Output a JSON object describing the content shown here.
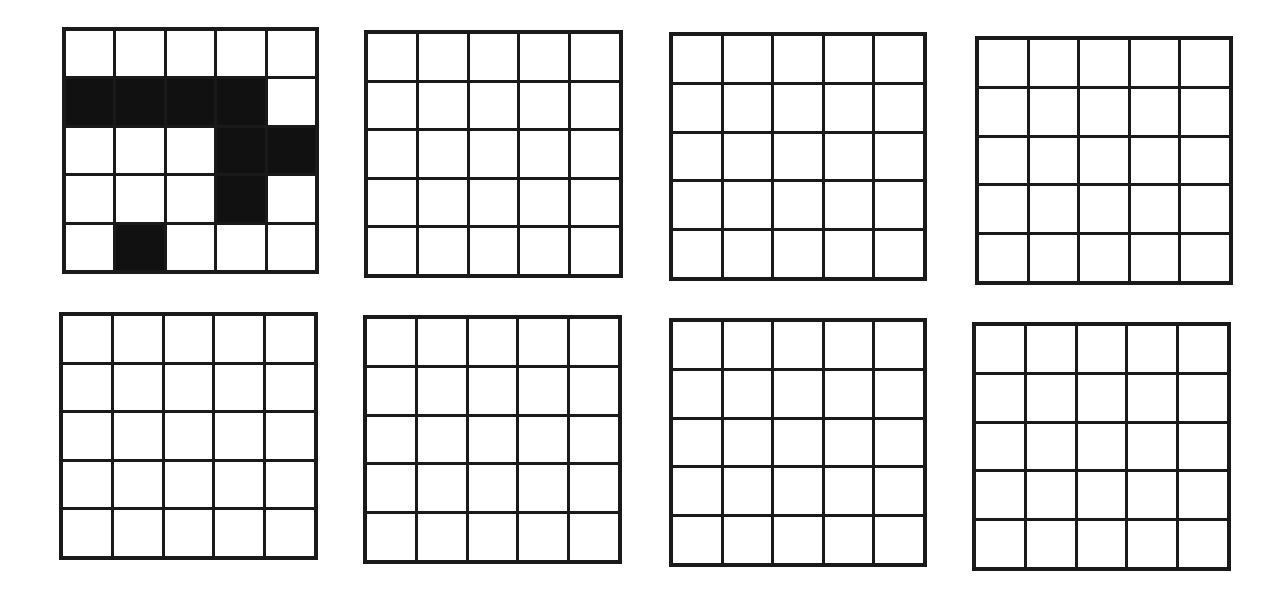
{
  "diagram": {
    "rows": 5,
    "cols": 5,
    "colors": {
      "filled": "#111111",
      "empty": "#ffffff",
      "line": "#1a1a1a"
    },
    "grids": [
      {
        "id": "grid-1",
        "position": {
          "x": 62,
          "y": 27,
          "w": 257,
          "h": 247
        },
        "filled_cells": [
          [
            1,
            0
          ],
          [
            1,
            1
          ],
          [
            1,
            2
          ],
          [
            1,
            3
          ],
          [
            2,
            3
          ],
          [
            2,
            4
          ],
          [
            3,
            3
          ],
          [
            4,
            1
          ]
        ]
      },
      {
        "id": "grid-2",
        "position": {
          "x": 364,
          "y": 30,
          "w": 259,
          "h": 248
        },
        "filled_cells": []
      },
      {
        "id": "grid-3",
        "position": {
          "x": 669,
          "y": 32,
          "w": 258,
          "h": 249
        },
        "filled_cells": []
      },
      {
        "id": "grid-4",
        "position": {
          "x": 975,
          "y": 36,
          "w": 258,
          "h": 249
        },
        "filled_cells": []
      },
      {
        "id": "grid-5",
        "position": {
          "x": 59,
          "y": 312,
          "w": 259,
          "h": 248
        },
        "filled_cells": []
      },
      {
        "id": "grid-6",
        "position": {
          "x": 363,
          "y": 315,
          "w": 259,
          "h": 249
        },
        "filled_cells": []
      },
      {
        "id": "grid-7",
        "position": {
          "x": 669,
          "y": 318,
          "w": 258,
          "h": 249
        },
        "filled_cells": []
      },
      {
        "id": "grid-8",
        "position": {
          "x": 972,
          "y": 322,
          "w": 259,
          "h": 249
        },
        "filled_cells": []
      }
    ]
  }
}
